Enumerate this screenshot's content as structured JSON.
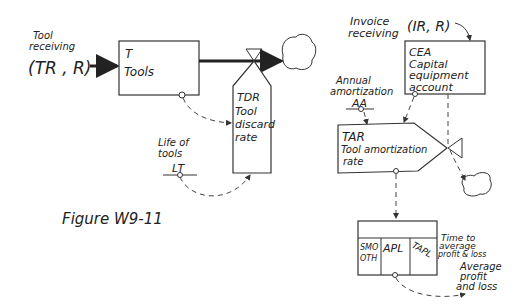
{
  "figure": {
    "caption": "Figure W9-11"
  },
  "tool_receiving": {
    "label_line1": "Tool",
    "label_line2": "receiving",
    "equation": "(TR , R)"
  },
  "tools_level": {
    "code": "T",
    "name": "Tools"
  },
  "tool_discard_rate": {
    "code": "TDR",
    "name_line1": "Tool",
    "name_line2": "discard",
    "name_line3": "rate"
  },
  "life_of_tools": {
    "label_line1": "Life of",
    "label_line2": "tools",
    "code": "LT"
  },
  "invoice_receiving": {
    "label_line1": "Invoice",
    "label_line2": "receiving",
    "equation": "(IR, R)"
  },
  "capital_equipment_account": {
    "code": "CEA",
    "name_line1": "Capital",
    "name_line2": "equipment",
    "name_line3": "account"
  },
  "annual_amortization": {
    "label_line1": "Annual",
    "label_line2": "amortization",
    "code": "AA"
  },
  "tool_amortization_rate": {
    "code": "TAR",
    "name_line1": "Tool amortization",
    "name_line2": "rate"
  },
  "smooth_box": {
    "cell1_line1": "SMO",
    "cell1_line2": "OTH",
    "cell2": "APL",
    "cell3": "TAPL"
  },
  "time_to_average": {
    "line1": "Time to",
    "line2": "average",
    "line3": "profit & loss"
  },
  "average_profit_loss": {
    "line1": "Average",
    "line2": "profit",
    "line3": "and loss"
  }
}
